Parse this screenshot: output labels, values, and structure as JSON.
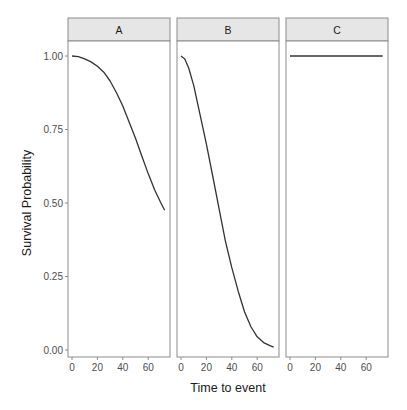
{
  "chart_data": {
    "type": "line",
    "title": "",
    "xlabel": "Time to event",
    "ylabel": "Survival Probability",
    "xlim": [
      -3,
      77
    ],
    "ylim": [
      -0.02,
      1.06
    ],
    "x_ticks": [
      0,
      20,
      40,
      60
    ],
    "x_tick_labels": [
      "0",
      "20",
      "40",
      "60"
    ],
    "y_ticks": [
      0,
      0.25,
      0.5,
      0.75,
      1.0
    ],
    "y_tick_labels": [
      "0.00",
      "0.25",
      "0.50",
      "0.75",
      "1.00"
    ],
    "grid": false,
    "legend": null,
    "facets": [
      {
        "label": "A",
        "series": [
          {
            "name": "A",
            "x": [
              0,
              5,
              10,
              15,
              20,
              25,
              30,
              35,
              40,
              45,
              50,
              55,
              60,
              65,
              70,
              73
            ],
            "y": [
              1.0,
              0.998,
              0.99,
              0.98,
              0.965,
              0.945,
              0.915,
              0.875,
              0.83,
              0.775,
              0.72,
              0.66,
              0.6,
              0.545,
              0.5,
              0.475
            ]
          }
        ]
      },
      {
        "label": "B",
        "series": [
          {
            "name": "B",
            "x": [
              0,
              3,
              6,
              10,
              15,
              20,
              25,
              30,
              35,
              40,
              45,
              50,
              55,
              60,
              65,
              70,
              73
            ],
            "y": [
              1.0,
              0.99,
              0.96,
              0.9,
              0.8,
              0.7,
              0.59,
              0.48,
              0.37,
              0.28,
              0.2,
              0.13,
              0.08,
              0.045,
              0.025,
              0.015,
              0.01
            ]
          }
        ]
      },
      {
        "label": "C",
        "series": [
          {
            "name": "C",
            "x": [
              0,
              73
            ],
            "y": [
              1.0,
              1.0
            ]
          }
        ]
      }
    ]
  },
  "colors": {
    "line": "#333333",
    "strip_fill": "#e6e6e6",
    "panel_border": "#8c8c8c",
    "tick_text": "#4d4d4d"
  }
}
